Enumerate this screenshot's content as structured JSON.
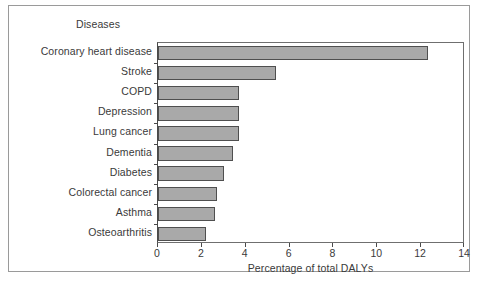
{
  "chart_data": {
    "type": "bar",
    "orientation": "horizontal",
    "title": "",
    "ylabel": "Diseases",
    "xlabel": "Percentage of total DALYs",
    "xlim": [
      0,
      14
    ],
    "xticks": [
      0,
      2,
      4,
      6,
      8,
      10,
      12,
      14
    ],
    "xtick_labels": [
      "0",
      "2",
      "4",
      "6",
      "8",
      "10",
      "12",
      "14"
    ],
    "grid": false,
    "legend": null,
    "bar_color": "#a9a9a9",
    "bar_edge_color": "#4f4f4f",
    "categories": [
      "Coronary heart disease",
      "Stroke",
      "COPD",
      "Depression",
      "Lung cancer",
      "Dementia",
      "Diabetes",
      "Colorectal cancer",
      "Asthma",
      "Osteoarthritis"
    ],
    "values": [
      12.3,
      5.4,
      3.7,
      3.7,
      3.7,
      3.4,
      3.0,
      2.7,
      2.6,
      2.2
    ]
  }
}
